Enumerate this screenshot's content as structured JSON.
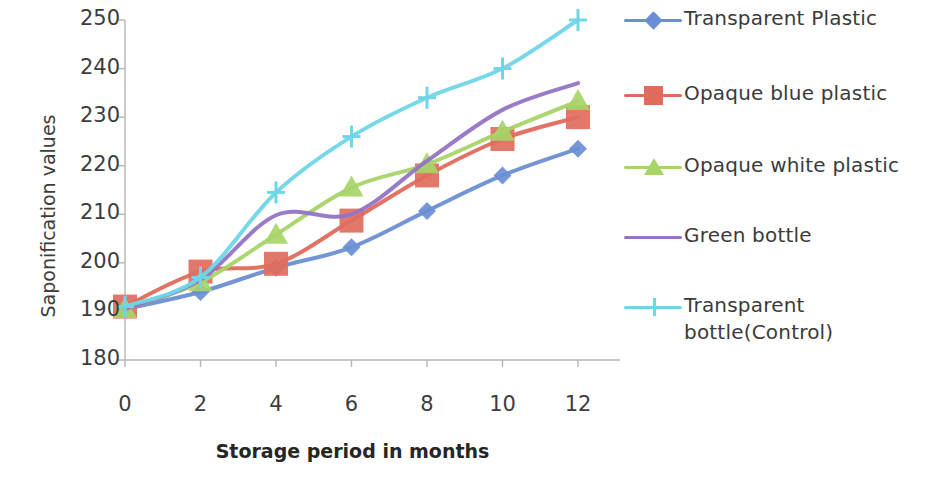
{
  "chart_data": {
    "type": "line",
    "title": "",
    "xlabel": "Storage period in months",
    "ylabel": "Saponification values",
    "x": [
      0,
      2,
      4,
      6,
      8,
      10,
      12
    ],
    "xticklabels": [
      "0",
      "2",
      "4",
      "6",
      "8",
      "10",
      "12"
    ],
    "yticklabels": [
      "180",
      "190",
      "200",
      "210",
      "220",
      "230",
      "240",
      "250"
    ],
    "xlim": [
      0,
      12
    ],
    "ylim": [
      180,
      250
    ],
    "grid": false,
    "legend_position": "right",
    "series": [
      {
        "name": "Transparent Plastic",
        "color": "#6b8fd4",
        "marker": "diamond",
        "values": [
          190.5,
          194.0,
          199.0,
          203.2,
          210.7,
          218.0,
          223.5
        ]
      },
      {
        "name": "Opaque blue plastic",
        "color": "#e06c5c",
        "marker": "square",
        "values": [
          191.0,
          198.2,
          199.8,
          208.7,
          218.0,
          225.5,
          230.0
        ]
      },
      {
        "name": "Opaque white plastic",
        "color": "#a8d468",
        "marker": "triangle",
        "values": [
          190.5,
          196.0,
          205.8,
          215.5,
          220.3,
          227.0,
          233.3
        ]
      },
      {
        "name": "Green bottle",
        "color": "#9474c4",
        "marker": "none",
        "values": [
          190.5,
          196.5,
          209.8,
          210.0,
          221.0,
          231.5,
          237.0
        ]
      },
      {
        "name": "Transparent bottle(Control)",
        "color": "#6fd6e8",
        "marker": "cross",
        "values": [
          191.0,
          197.0,
          214.5,
          226.0,
          234.0,
          240.0,
          250.0
        ]
      }
    ]
  },
  "legend": {
    "items": [
      {
        "label": "Transparent Plastic"
      },
      {
        "label": "Opaque blue plastic"
      },
      {
        "label": "Opaque white plastic"
      },
      {
        "label": "Green bottle"
      },
      {
        "label": "Transparent bottle(Control)"
      }
    ]
  }
}
